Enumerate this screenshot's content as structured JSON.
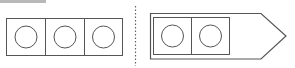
{
  "colors": {
    "stroke": "#555555",
    "dotted": "#666666",
    "topbar": "#b8b8b8",
    "background": "#ffffff"
  },
  "left_strip": {
    "cells": 3,
    "circles": 3
  },
  "right_shape": {
    "type": "arrow-pentagon",
    "cells": 2,
    "circles": 2
  },
  "divider": {
    "style": "dotted",
    "orientation": "vertical"
  }
}
